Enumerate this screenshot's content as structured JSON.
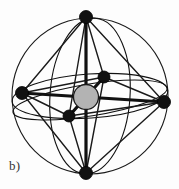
{
  "figure": {
    "panel_label": "b)",
    "caption_text": "b)",
    "background_color": "#fdfdfd",
    "line_color": "#111111",
    "thin_line_color": "#1a1a1a",
    "central_atom": {
      "name": "central-atom",
      "fill_color": "#b3b3b3",
      "stroke_color": "#1a1a1a",
      "cx": 86,
      "cy": 97,
      "r": 12.5
    },
    "sphere": {
      "name": "circumscribed-sphere",
      "cx": 90,
      "cy": 96,
      "r": 78,
      "stroke_color": "#1a1a1a",
      "stroke_width": 1.1
    },
    "equatorial_ellipses": [
      {
        "cx": 90,
        "cy": 96,
        "rx": 78,
        "ry": 22,
        "rotation": -4
      },
      {
        "cx": 90,
        "cy": 100,
        "rx": 78,
        "ry": 16,
        "rotation": -9
      }
    ],
    "meridian_ellipses": [
      {
        "cx": 90,
        "cy": 96,
        "rx": 40,
        "ry": 78,
        "rotation": 4
      }
    ],
    "vertices": [
      {
        "id": "v-top",
        "label": "top-vertex",
        "x": 86,
        "y": 17,
        "r": 6.5
      },
      {
        "id": "v-bottom",
        "label": "bottom-vertex",
        "x": 86,
        "y": 173,
        "r": 6.5
      },
      {
        "id": "v-left",
        "label": "left-vertex",
        "x": 22,
        "y": 93,
        "r": 6.5
      },
      {
        "id": "v-right",
        "label": "right-vertex",
        "x": 164,
        "y": 102,
        "r": 6.5
      },
      {
        "id": "v-front",
        "label": "front-vertex",
        "x": 69,
        "y": 116,
        "r": 6.0
      },
      {
        "id": "v-back",
        "label": "back-vertex",
        "x": 104,
        "y": 77,
        "r": 6.0
      }
    ],
    "octahedron_edges": [
      {
        "from": "v-top",
        "to": "v-left",
        "weight": "thick"
      },
      {
        "from": "v-top",
        "to": "v-right",
        "weight": "thick"
      },
      {
        "from": "v-top",
        "to": "v-front",
        "weight": "thick"
      },
      {
        "from": "v-top",
        "to": "v-back",
        "weight": "thick"
      },
      {
        "from": "v-bottom",
        "to": "v-left",
        "weight": "thick"
      },
      {
        "from": "v-bottom",
        "to": "v-right",
        "weight": "thick"
      },
      {
        "from": "v-bottom",
        "to": "v-front",
        "weight": "thick"
      },
      {
        "from": "v-bottom",
        "to": "v-back",
        "weight": "thick"
      },
      {
        "from": "v-left",
        "to": "v-front",
        "weight": "thick"
      },
      {
        "from": "v-left",
        "to": "v-back",
        "weight": "thick"
      },
      {
        "from": "v-right",
        "to": "v-front",
        "weight": "thick"
      },
      {
        "from": "v-right",
        "to": "v-back",
        "weight": "thick"
      }
    ],
    "axis_bonds": [
      {
        "from": "v-top",
        "to": "v-bottom",
        "weight": "axis"
      },
      {
        "from": "v-left",
        "to": "v-right",
        "weight": "axis"
      },
      {
        "from": "v-front",
        "to": "v-back",
        "weight": "axis"
      }
    ],
    "thin_chords": [
      {
        "from": "v-left",
        "to": "v-right"
      },
      {
        "from": "v-top",
        "to": "v-bottom"
      }
    ]
  }
}
